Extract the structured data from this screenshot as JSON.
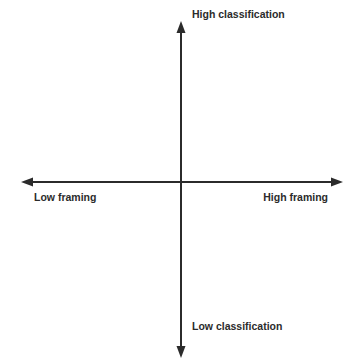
{
  "diagram": {
    "type": "quadrant-axes",
    "colors": {
      "axis": "#2b2b2b",
      "text": "#2b2b2b",
      "background": "#ffffff"
    },
    "axes": {
      "vertical": {
        "top_label": "High classification",
        "bottom_label": "Low classification"
      },
      "horizontal": {
        "left_label": "Low framing",
        "right_label": "High framing"
      }
    }
  }
}
